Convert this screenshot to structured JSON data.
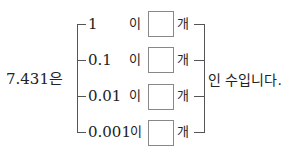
{
  "subject": "7.431은",
  "rows": [
    {
      "unit": "1",
      "particle": "이",
      "blank": "",
      "counter": "개"
    },
    {
      "unit": "0.1",
      "particle": "이",
      "blank": "",
      "counter": "개"
    },
    {
      "unit": "0.01",
      "particle": "이",
      "blank": "",
      "counter": "개"
    },
    {
      "unit": "0.001",
      "particle": "이",
      "blank": "",
      "counter": "개"
    }
  ],
  "conclusion": "인 수입니다."
}
